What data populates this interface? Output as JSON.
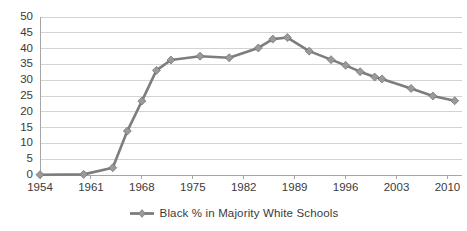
{
  "chart_data": {
    "type": "line",
    "title": "",
    "xlabel": "",
    "ylabel": "",
    "ylim": [
      0,
      50
    ],
    "ytick_step": 5,
    "yticks": [
      0,
      5,
      10,
      15,
      20,
      25,
      30,
      35,
      40,
      45,
      50
    ],
    "xticks": [
      1954,
      1961,
      1968,
      1975,
      1982,
      1989,
      1996,
      2003,
      2010
    ],
    "xlim": [
      1954,
      2012
    ],
    "grid": true,
    "legend_position": "bottom",
    "series": [
      {
        "name": "Black % in Majority White Schools",
        "color": "#7d7d7d",
        "marker": "diamond",
        "x": [
          1954,
          1960,
          1964,
          1966,
          1968,
          1970,
          1972,
          1976,
          1980,
          1984,
          1986,
          1988,
          1991,
          1994,
          1996,
          1998,
          2000,
          2001,
          2005,
          2008,
          2011
        ],
        "values": [
          0.1,
          0.2,
          2.3,
          13.9,
          23.4,
          33.1,
          36.4,
          37.6,
          37.1,
          40.2,
          43.0,
          43.5,
          39.2,
          36.5,
          34.7,
          32.7,
          31.0,
          30.4,
          27.4,
          25.0,
          23.5
        ]
      }
    ]
  },
  "legend": {
    "entries": [
      {
        "label": "Black % in Majority White Schools",
        "color": "#7d7d7d"
      }
    ]
  }
}
